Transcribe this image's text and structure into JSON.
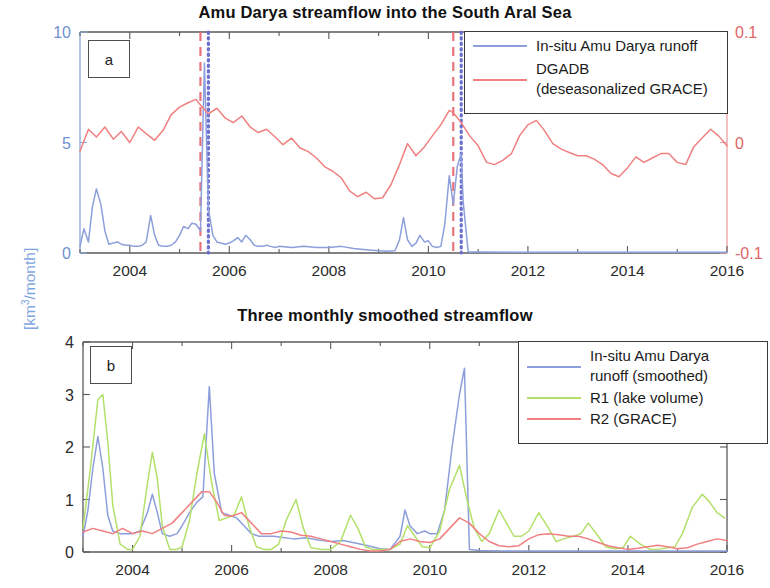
{
  "figure": {
    "y_axis_label_left_global": "[km3/month]",
    "y_axis_label_left_global_display": "[km",
    "y_axis_label_exp": "3",
    "y_axis_label_tail": "/month]"
  },
  "panel_a": {
    "tag": "a",
    "title": "Amu Darya streamflow into the South Aral Sea",
    "colors": {
      "runoff": "#8d9fdb",
      "grace": "#f08080",
      "left_axis": "#6f8fd0",
      "right_axis": "#e06666",
      "marker_red_dashed": "#e8737a",
      "marker_blue_dotted": "#6a6fd0"
    },
    "legend": [
      {
        "label": "In-situ Amu Darya runoff",
        "label2": "",
        "color": "#8d9fdb"
      },
      {
        "label": "DGADB",
        "label2": "(deseasonalized GRACE)",
        "color": "#f08080"
      }
    ],
    "y_left_ticks": [
      "0",
      "5",
      "10"
    ],
    "y_right_ticks": [
      "-0.1",
      "0",
      "0.1"
    ],
    "x_ticks": [
      "2004",
      "2006",
      "2008",
      "2010",
      "2012",
      "2014",
      "2016"
    ]
  },
  "panel_b": {
    "tag": "b",
    "title": "Three monthly smoothed streamflow",
    "colors": {
      "runoff": "#8d9fdb",
      "r1": "#b3e06a",
      "r2": "#f08080"
    },
    "legend": [
      {
        "label": "In-situ Amu Darya",
        "label2": "runoff (smoothed)",
        "color": "#8d9fdb"
      },
      {
        "label": "R1 (lake volume)",
        "label2": "",
        "color": "#b3e06a"
      },
      {
        "label": "R2 (GRACE)",
        "label2": "",
        "color": "#f08080"
      }
    ],
    "y_ticks": [
      "0",
      "1",
      "2",
      "3",
      "4"
    ],
    "x_ticks": [
      "2004",
      "2006",
      "2008",
      "2010",
      "2012",
      "2014",
      "2016"
    ]
  },
  "chart_data": [
    {
      "type": "line",
      "panel": "a",
      "title": "Amu Darya streamflow into the South Aral Sea",
      "xlabel": "",
      "ylabel": "[km3/month]",
      "ylabel_right": "",
      "xlim": [
        2003.0,
        2016.0
      ],
      "ylim": [
        0,
        10
      ],
      "ylim_right": [
        -0.1,
        0.1
      ],
      "xticks": [
        2004,
        2006,
        2008,
        2010,
        2012,
        2014,
        2016
      ],
      "yticks": [
        0,
        5,
        10
      ],
      "yticks_right": [
        -0.1,
        0,
        0.1
      ],
      "grid": false,
      "legend_position": "top-right",
      "annotations": [
        {
          "type": "vline",
          "x": 2005.42,
          "style": "dashed",
          "color": "#e8737a"
        },
        {
          "type": "vline",
          "x": 2005.58,
          "style": "dotted",
          "color": "#6a6fd0"
        },
        {
          "type": "vline",
          "x": 2010.5,
          "style": "dashed",
          "color": "#e8737a"
        },
        {
          "type": "vline",
          "x": 2010.66,
          "style": "dotted",
          "color": "#6a6fd0"
        }
      ],
      "series": [
        {
          "name": "In-situ Amu Darya runoff",
          "color": "#8d9fdb",
          "axis": "left",
          "x": [
            2003.0,
            2003.08,
            2003.17,
            2003.25,
            2003.33,
            2003.42,
            2003.5,
            2003.58,
            2003.67,
            2003.75,
            2003.83,
            2003.92,
            2004.0,
            2004.08,
            2004.17,
            2004.25,
            2004.33,
            2004.42,
            2004.5,
            2004.58,
            2004.67,
            2004.75,
            2004.83,
            2004.92,
            2005.0,
            2005.08,
            2005.17,
            2005.25,
            2005.33,
            2005.42,
            2005.5,
            2005.58,
            2005.67,
            2005.75,
            2005.83,
            2005.92,
            2006.0,
            2006.08,
            2006.17,
            2006.25,
            2006.33,
            2006.42,
            2006.5,
            2006.58,
            2006.67,
            2006.75,
            2006.83,
            2006.92,
            2007.0,
            2007.25,
            2007.5,
            2007.75,
            2008.0,
            2008.25,
            2008.5,
            2008.75,
            2009.0,
            2009.17,
            2009.33,
            2009.42,
            2009.5,
            2009.58,
            2009.67,
            2009.75,
            2009.83,
            2009.92,
            2010.0,
            2010.08,
            2010.17,
            2010.25,
            2010.33,
            2010.42,
            2010.5,
            2010.58,
            2010.66,
            2010.7,
            2010.8,
            2011.0,
            2012.0,
            2013.0,
            2014.0,
            2015.0,
            2016.0
          ],
          "y": [
            0.3,
            1.1,
            0.5,
            2.1,
            2.9,
            2.2,
            1.0,
            0.4,
            0.45,
            0.5,
            0.4,
            0.35,
            0.35,
            0.3,
            0.3,
            0.35,
            0.5,
            1.7,
            0.8,
            0.35,
            0.3,
            0.3,
            0.35,
            0.5,
            0.8,
            1.2,
            1.1,
            1.35,
            1.3,
            1.0,
            8.6,
            2.0,
            0.8,
            0.5,
            0.45,
            0.4,
            0.45,
            0.55,
            0.7,
            0.5,
            0.8,
            0.6,
            0.35,
            0.3,
            0.3,
            0.35,
            0.3,
            0.25,
            0.3,
            0.25,
            0.3,
            0.25,
            0.25,
            0.3,
            0.2,
            0.15,
            0.1,
            0.08,
            0.1,
            0.6,
            1.6,
            0.6,
            0.3,
            0.45,
            0.8,
            0.5,
            0.55,
            0.3,
            0.25,
            0.3,
            1.3,
            3.5,
            2.2,
            3.9,
            4.5,
            2.3,
            0.05,
            0.04,
            0.03,
            0.03,
            0.03,
            0.03,
            0.03
          ],
          "unit": "km3/month"
        },
        {
          "name": "DGADB (deseasonalized GRACE)",
          "color": "#f08080",
          "axis": "right",
          "x": [
            2003.0,
            2003.17,
            2003.33,
            2003.5,
            2003.67,
            2003.83,
            2004.0,
            2004.17,
            2004.33,
            2004.5,
            2004.67,
            2004.83,
            2005.0,
            2005.17,
            2005.33,
            2005.42,
            2005.58,
            2005.75,
            2005.92,
            2006.08,
            2006.25,
            2006.42,
            2006.58,
            2006.75,
            2006.92,
            2007.08,
            2007.25,
            2007.42,
            2007.58,
            2007.75,
            2007.92,
            2008.08,
            2008.25,
            2008.42,
            2008.58,
            2008.75,
            2008.92,
            2009.08,
            2009.25,
            2009.42,
            2009.58,
            2009.75,
            2009.92,
            2010.08,
            2010.25,
            2010.42,
            2010.5,
            2010.66,
            2010.83,
            2011.0,
            2011.17,
            2011.33,
            2011.5,
            2011.67,
            2011.83,
            2012.0,
            2012.17,
            2012.33,
            2012.5,
            2012.67,
            2012.83,
            2013.0,
            2013.17,
            2013.33,
            2013.5,
            2013.67,
            2013.83,
            2014.0,
            2014.17,
            2014.33,
            2014.5,
            2014.67,
            2014.83,
            2015.0,
            2015.17,
            2015.33,
            2015.5,
            2015.67,
            2015.83,
            2016.0
          ],
          "y_right": [
            -0.008,
            0.012,
            0.005,
            0.014,
            0.003,
            0.01,
            0.0,
            0.014,
            0.008,
            0.002,
            0.011,
            0.025,
            0.032,
            0.036,
            0.039,
            0.034,
            0.026,
            0.031,
            0.022,
            0.018,
            0.024,
            0.014,
            0.009,
            0.012,
            0.005,
            -0.002,
            0.004,
            -0.005,
            -0.008,
            -0.014,
            -0.022,
            -0.026,
            -0.032,
            -0.044,
            -0.049,
            -0.045,
            -0.051,
            -0.05,
            -0.038,
            -0.02,
            -0.001,
            -0.012,
            -0.004,
            0.006,
            0.016,
            0.029,
            0.027,
            0.018,
            0.006,
            -0.003,
            -0.018,
            -0.02,
            -0.016,
            -0.01,
            0.006,
            0.016,
            0.02,
            0.011,
            -0.001,
            -0.006,
            -0.009,
            -0.012,
            -0.012,
            -0.015,
            -0.02,
            -0.028,
            -0.031,
            -0.023,
            -0.013,
            -0.018,
            -0.014,
            -0.01,
            -0.01,
            -0.018,
            -0.02,
            -0.004,
            0.004,
            0.012,
            0.006,
            -0.003
          ],
          "unit": ""
        }
      ]
    },
    {
      "type": "line",
      "panel": "b",
      "title": "Three monthly smoothed streamflow",
      "xlabel": "",
      "ylabel": "[km3/month]",
      "xlim": [
        2003.0,
        2016.0
      ],
      "ylim": [
        0,
        4
      ],
      "xticks": [
        2004,
        2006,
        2008,
        2010,
        2012,
        2014,
        2016
      ],
      "yticks": [
        0,
        1,
        2,
        3,
        4
      ],
      "grid": false,
      "legend_position": "top-right",
      "series": [
        {
          "name": "In-situ Amu Darya runoff (smoothed)",
          "color": "#8d9fdb",
          "x": [
            2003.0,
            2003.1,
            2003.2,
            2003.3,
            2003.4,
            2003.5,
            2003.6,
            2003.75,
            2003.9,
            2004.0,
            2004.15,
            2004.3,
            2004.4,
            2004.5,
            2004.6,
            2004.75,
            2004.9,
            2005.0,
            2005.15,
            2005.3,
            2005.42,
            2005.55,
            2005.65,
            2005.8,
            2005.95,
            2006.1,
            2006.25,
            2006.4,
            2006.55,
            2006.7,
            2006.85,
            2007.0,
            2007.25,
            2007.5,
            2007.75,
            2008.0,
            2008.25,
            2008.5,
            2008.75,
            2009.0,
            2009.2,
            2009.4,
            2009.5,
            2009.6,
            2009.75,
            2009.9,
            2010.0,
            2010.15,
            2010.3,
            2010.45,
            2010.6,
            2010.7,
            2010.8,
            2011.0,
            2011.5,
            2012.0,
            2013.0,
            2014.0,
            2015.0,
            2016.0
          ],
          "y": [
            0.3,
            0.8,
            1.6,
            2.2,
            1.6,
            0.7,
            0.4,
            0.35,
            0.35,
            0.35,
            0.4,
            0.75,
            1.1,
            0.75,
            0.35,
            0.3,
            0.35,
            0.5,
            0.75,
            0.95,
            1.05,
            3.15,
            1.5,
            0.75,
            0.7,
            0.65,
            0.5,
            0.35,
            0.3,
            0.3,
            0.3,
            0.28,
            0.25,
            0.27,
            0.23,
            0.2,
            0.22,
            0.17,
            0.12,
            0.06,
            0.05,
            0.3,
            0.8,
            0.5,
            0.35,
            0.4,
            0.35,
            0.35,
            0.8,
            2.0,
            3.0,
            3.5,
            0.05,
            0.03,
            0.02,
            0.02,
            0.02,
            0.02,
            0.02,
            0.02
          ],
          "unit": "km3/month"
        },
        {
          "name": "R1 (lake volume)",
          "color": "#b3e06a",
          "x": [
            2003.0,
            2003.15,
            2003.3,
            2003.4,
            2003.5,
            2003.6,
            2003.75,
            2003.9,
            2004.0,
            2004.15,
            2004.3,
            2004.4,
            2004.5,
            2004.6,
            2004.75,
            2004.9,
            2005.0,
            2005.15,
            2005.3,
            2005.45,
            2005.6,
            2005.75,
            2005.9,
            2006.05,
            2006.2,
            2006.35,
            2006.5,
            2006.65,
            2006.8,
            2006.95,
            2007.1,
            2007.3,
            2007.45,
            2007.6,
            2007.8,
            2008.0,
            2008.2,
            2008.4,
            2008.55,
            2008.7,
            2008.85,
            2009.0,
            2009.2,
            2009.4,
            2009.55,
            2009.7,
            2009.85,
            2010.0,
            2010.2,
            2010.4,
            2010.6,
            2010.75,
            2010.9,
            2011.05,
            2011.2,
            2011.4,
            2011.55,
            2011.7,
            2011.85,
            2012.0,
            2012.2,
            2012.4,
            2012.55,
            2012.7,
            2012.9,
            2013.05,
            2013.2,
            2013.4,
            2013.55,
            2013.75,
            2013.9,
            2014.05,
            2014.25,
            2014.45,
            2014.6,
            2014.8,
            2014.95,
            2015.1,
            2015.3,
            2015.5,
            2015.65,
            2015.8,
            2015.95
          ],
          "y": [
            0.45,
            1.6,
            2.9,
            3.0,
            2.1,
            0.9,
            0.15,
            0.05,
            0.05,
            0.3,
            1.3,
            1.9,
            1.4,
            0.5,
            0.05,
            0.05,
            0.1,
            0.6,
            1.5,
            2.25,
            1.3,
            0.6,
            0.65,
            0.7,
            1.05,
            0.5,
            0.1,
            0.05,
            0.05,
            0.15,
            0.6,
            1.0,
            0.45,
            0.08,
            0.05,
            0.05,
            0.2,
            0.7,
            0.45,
            0.1,
            0.05,
            0.05,
            0.05,
            0.15,
            0.5,
            0.3,
            0.1,
            0.08,
            0.4,
            1.2,
            1.65,
            1.0,
            0.45,
            0.2,
            0.35,
            0.8,
            0.55,
            0.3,
            0.3,
            0.4,
            0.75,
            0.45,
            0.2,
            0.25,
            0.3,
            0.35,
            0.55,
            0.3,
            0.1,
            0.06,
            0.08,
            0.3,
            0.15,
            0.05,
            0.05,
            0.08,
            0.1,
            0.35,
            0.85,
            1.1,
            0.95,
            0.75,
            0.65
          ],
          "unit": "km3/month"
        },
        {
          "name": "R2 (GRACE)",
          "color": "#f08080",
          "x": [
            2003.0,
            2003.2,
            2003.4,
            2003.6,
            2003.8,
            2004.0,
            2004.2,
            2004.4,
            2004.6,
            2004.8,
            2005.0,
            2005.2,
            2005.4,
            2005.55,
            2005.7,
            2005.85,
            2006.0,
            2006.2,
            2006.4,
            2006.6,
            2006.8,
            2007.0,
            2007.2,
            2007.4,
            2007.6,
            2007.8,
            2008.0,
            2008.2,
            2008.4,
            2008.6,
            2008.8,
            2009.0,
            2009.2,
            2009.4,
            2009.6,
            2009.8,
            2010.0,
            2010.2,
            2010.4,
            2010.6,
            2010.8,
            2011.0,
            2011.2,
            2011.4,
            2011.6,
            2011.8,
            2012.0,
            2012.2,
            2012.4,
            2012.6,
            2012.8,
            2013.0,
            2013.2,
            2013.4,
            2013.6,
            2013.8,
            2014.0,
            2014.2,
            2014.4,
            2014.6,
            2014.8,
            2015.0,
            2015.2,
            2015.4,
            2015.6,
            2015.8,
            2016.0
          ],
          "y": [
            0.38,
            0.45,
            0.4,
            0.35,
            0.45,
            0.35,
            0.4,
            0.35,
            0.45,
            0.55,
            0.75,
            0.95,
            1.15,
            1.15,
            0.95,
            0.7,
            0.68,
            0.75,
            0.55,
            0.35,
            0.35,
            0.4,
            0.38,
            0.32,
            0.3,
            0.25,
            0.2,
            0.15,
            0.1,
            0.05,
            0.02,
            0.02,
            0.05,
            0.2,
            0.25,
            0.2,
            0.18,
            0.25,
            0.45,
            0.65,
            0.55,
            0.35,
            0.2,
            0.12,
            0.1,
            0.12,
            0.25,
            0.33,
            0.35,
            0.33,
            0.3,
            0.3,
            0.25,
            0.18,
            0.12,
            0.08,
            0.05,
            0.07,
            0.1,
            0.13,
            0.1,
            0.06,
            0.08,
            0.15,
            0.2,
            0.25,
            0.22
          ],
          "unit": "km3/month"
        }
      ]
    }
  ]
}
